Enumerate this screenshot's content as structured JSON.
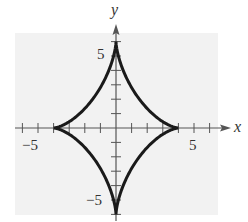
{
  "chart_data": {
    "type": "line",
    "title": "",
    "xlabel": "x",
    "ylabel": "y",
    "xlim": [
      -6,
      6
    ],
    "ylim": [
      -6,
      6
    ],
    "x_ticks_labeled": [
      -5,
      5
    ],
    "y_ticks_labeled": [
      5,
      -5
    ],
    "x_tick_labels": [
      "−5",
      "5"
    ],
    "y_tick_labels": [
      "5",
      "−5"
    ],
    "tick_spacing": 1,
    "grid": false,
    "legend": null,
    "series": [
      {
        "name": "astroid",
        "parametric": "x = 4cos^3(t), y = 6sin^3(t)",
        "cusps": [
          [
            4,
            0
          ],
          [
            0,
            6
          ],
          [
            -4,
            0
          ],
          [
            0,
            -6
          ]
        ],
        "a": 4,
        "b": 6
      }
    ]
  },
  "colors": {
    "background": "#f2f2f2",
    "curve": "#1a1a1a",
    "axis": "#555555"
  }
}
